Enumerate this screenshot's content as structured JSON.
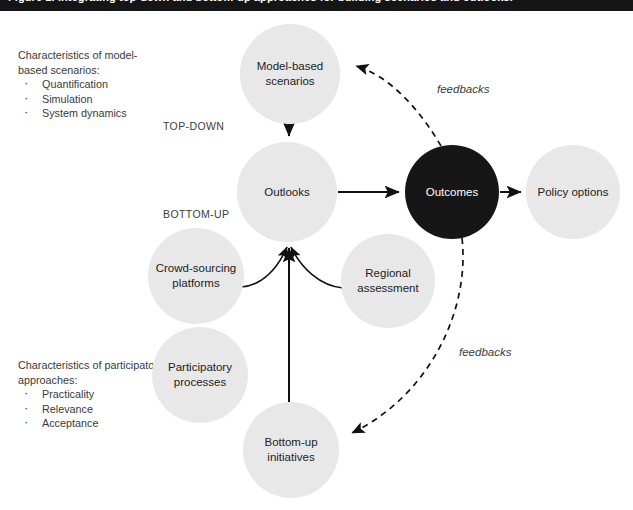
{
  "caption": {
    "text": "Figure 1. Integrating top-down and bottom-up approaches for building scenarios and outlooks."
  },
  "axis_labels": {
    "top_down": "TOP-DOWN",
    "bottom_up": "BOTTOM-UP"
  },
  "side_blocks": [
    {
      "id": "model",
      "heading": "Characteristics of model-based scenarios:",
      "items": [
        "Quantification",
        "Simulation",
        "System dynamics"
      ]
    },
    {
      "id": "participatory",
      "heading": "Characteristics of participatory approaches:",
      "items": [
        "Practicality",
        "Relevance",
        "Acceptance"
      ]
    }
  ],
  "nodes": [
    {
      "id": "model-based-scenarios",
      "label_line1": "Model-based",
      "label_line2": "scenarios",
      "cx": 290,
      "cy": 74,
      "r": 50,
      "style": "light"
    },
    {
      "id": "outlooks",
      "label_line1": "Outlooks",
      "label_line2": "",
      "cx": 287,
      "cy": 192,
      "r": 50,
      "style": "light"
    },
    {
      "id": "outcomes",
      "label_line1": "Outcomes",
      "label_line2": "",
      "cx": 452,
      "cy": 192,
      "r": 47,
      "style": "dark"
    },
    {
      "id": "policy-options",
      "label_line1": "Policy options",
      "label_line2": "",
      "cx": 573,
      "cy": 192,
      "r": 47,
      "style": "light"
    },
    {
      "id": "crowd-sourcing-platforms",
      "label_line1": "Crowd-sourcing",
      "label_line2": "platforms",
      "cx": 196,
      "cy": 276,
      "r": 48,
      "style": "light"
    },
    {
      "id": "regional-assessment",
      "label_line1": "Regional",
      "label_line2": "assessment",
      "cx": 388,
      "cy": 281,
      "r": 47,
      "style": "light"
    },
    {
      "id": "participatory-processes",
      "label_line1": "Participatory",
      "label_line2": "processes",
      "cx": 200,
      "cy": 375,
      "r": 48,
      "style": "light"
    },
    {
      "id": "bottom-up-initiatives",
      "label_line1": "Bottom-up",
      "label_line2": "initiatives",
      "cx": 291,
      "cy": 450,
      "r": 48,
      "style": "light"
    }
  ],
  "feedback_labels": {
    "upper": "feedbacks",
    "lower": "feedbacks"
  },
  "colors": {
    "node_light": "#e8e8e8",
    "node_dark": "#161616",
    "stroke": "#111111",
    "caption_bar": "#151515",
    "text": "#3a3a3a"
  }
}
